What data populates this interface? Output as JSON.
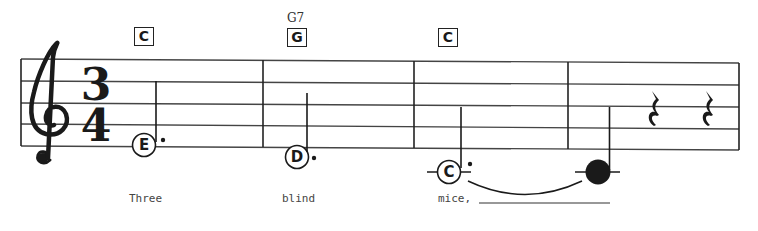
{
  "score": {
    "clef": "treble",
    "time_signature": {
      "top": "3",
      "bottom": "4"
    },
    "colors": {
      "ink": "#1a1a1a",
      "staff": "#444444",
      "lyric": "#444444",
      "background": "#ffffff"
    },
    "measures": [
      {
        "chord_box": "C",
        "chord_name": "",
        "note": {
          "letter": "E",
          "duration": "dotted-half",
          "filled": false
        },
        "lyric": "Three"
      },
      {
        "chord_box": "G",
        "chord_name": "G7",
        "note": {
          "letter": "D",
          "duration": "dotted-half",
          "filled": false
        },
        "lyric": "blind"
      },
      {
        "chord_box": "C",
        "chord_name": "",
        "note": {
          "letter": "C",
          "duration": "dotted-half",
          "filled": false,
          "tied": true
        },
        "lyric": "mice,"
      },
      {
        "chord_box": "",
        "chord_name": "",
        "note": {
          "letter": "",
          "duration": "quarter",
          "filled": true,
          "tied": true
        },
        "rests": [
          "quarter-rest",
          "quarter-rest"
        ],
        "lyric": ""
      }
    ]
  }
}
